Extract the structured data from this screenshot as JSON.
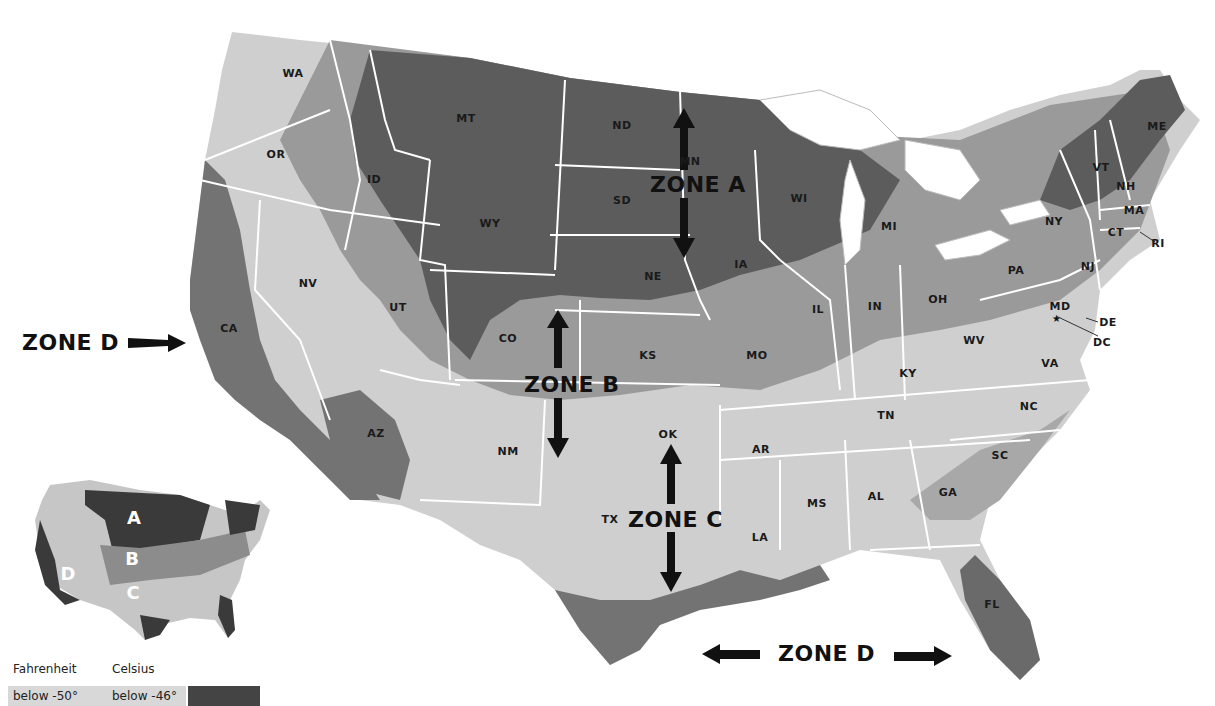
{
  "map": {
    "title": "US Climate Zones",
    "colors": {
      "zone_a": "#5a5a5a",
      "zone_a_dark": "#4a4a4a",
      "zone_b": "#8c8c8c",
      "zone_c": "#c8c8c8",
      "zone_c_light": "#dcdcdc",
      "zone_d": "#6e6e6e",
      "border": "#ffffff",
      "water": "#ffffff"
    },
    "states": [
      {
        "abbr": "WA",
        "x": 293,
        "y": 73
      },
      {
        "abbr": "OR",
        "x": 276,
        "y": 154
      },
      {
        "abbr": "ID",
        "x": 374,
        "y": 179
      },
      {
        "abbr": "MT",
        "x": 466,
        "y": 118
      },
      {
        "abbr": "WY",
        "x": 490,
        "y": 223
      },
      {
        "abbr": "NV",
        "x": 308,
        "y": 283
      },
      {
        "abbr": "UT",
        "x": 398,
        "y": 307
      },
      {
        "abbr": "CA",
        "x": 229,
        "y": 328
      },
      {
        "abbr": "AZ",
        "x": 376,
        "y": 433
      },
      {
        "abbr": "CO",
        "x": 508,
        "y": 338
      },
      {
        "abbr": "NM",
        "x": 508,
        "y": 451
      },
      {
        "abbr": "ND",
        "x": 622,
        "y": 125
      },
      {
        "abbr": "SD",
        "x": 622,
        "y": 200
      },
      {
        "abbr": "NE",
        "x": 653,
        "y": 276
      },
      {
        "abbr": "KS",
        "x": 648,
        "y": 355
      },
      {
        "abbr": "OK",
        "x": 668,
        "y": 434
      },
      {
        "abbr": "TX",
        "x": 610,
        "y": 519
      },
      {
        "abbr": "MN",
        "x": 690,
        "y": 161
      },
      {
        "abbr": "IA",
        "x": 741,
        "y": 264
      },
      {
        "abbr": "MO",
        "x": 757,
        "y": 355
      },
      {
        "abbr": "AR",
        "x": 761,
        "y": 449
      },
      {
        "abbr": "LA",
        "x": 760,
        "y": 537
      },
      {
        "abbr": "WI",
        "x": 799,
        "y": 198
      },
      {
        "abbr": "IL",
        "x": 818,
        "y": 309
      },
      {
        "abbr": "MI",
        "x": 889,
        "y": 226
      },
      {
        "abbr": "IN",
        "x": 875,
        "y": 306
      },
      {
        "abbr": "OH",
        "x": 938,
        "y": 299
      },
      {
        "abbr": "KY",
        "x": 908,
        "y": 373
      },
      {
        "abbr": "TN",
        "x": 886,
        "y": 415
      },
      {
        "abbr": "MS",
        "x": 817,
        "y": 503
      },
      {
        "abbr": "AL",
        "x": 876,
        "y": 496
      },
      {
        "abbr": "GA",
        "x": 948,
        "y": 492
      },
      {
        "abbr": "FL",
        "x": 992,
        "y": 604
      },
      {
        "abbr": "SC",
        "x": 1000,
        "y": 455
      },
      {
        "abbr": "NC",
        "x": 1029,
        "y": 406
      },
      {
        "abbr": "VA",
        "x": 1050,
        "y": 363
      },
      {
        "abbr": "WV",
        "x": 974,
        "y": 340
      },
      {
        "abbr": "PA",
        "x": 1016,
        "y": 270
      },
      {
        "abbr": "NY",
        "x": 1054,
        "y": 221
      },
      {
        "abbr": "NJ",
        "x": 1088,
        "y": 266
      },
      {
        "abbr": "MD",
        "x": 1060,
        "y": 306
      },
      {
        "abbr": "DE",
        "x": 1108,
        "y": 322
      },
      {
        "abbr": "DC",
        "x": 1102,
        "y": 342
      },
      {
        "abbr": "VT",
        "x": 1101,
        "y": 167
      },
      {
        "abbr": "NH",
        "x": 1126,
        "y": 186
      },
      {
        "abbr": "ME",
        "x": 1157,
        "y": 126
      },
      {
        "abbr": "MA",
        "x": 1134,
        "y": 210
      },
      {
        "abbr": "CT",
        "x": 1116,
        "y": 232
      },
      {
        "abbr": "RI",
        "x": 1158,
        "y": 243
      }
    ],
    "zones": [
      {
        "id": "zone-a",
        "label": "ZONE A",
        "x": 650,
        "y": 172
      },
      {
        "id": "zone-b",
        "label": "ZONE B",
        "x": 524,
        "y": 372
      },
      {
        "id": "zone-c",
        "label": "ZONE C",
        "x": 628,
        "y": 507
      },
      {
        "id": "zone-d-west",
        "label": "ZONE D",
        "x": 22,
        "y": 330
      },
      {
        "id": "zone-d-south",
        "label": "ZONE D",
        "x": 778,
        "y": 641
      }
    ]
  },
  "inset": {
    "labels": [
      {
        "letter": "A",
        "x": 134,
        "y": 517
      },
      {
        "letter": "B",
        "x": 132,
        "y": 558
      },
      {
        "letter": "C",
        "x": 133,
        "y": 592
      },
      {
        "letter": "D",
        "x": 68,
        "y": 573
      }
    ]
  },
  "legend": {
    "fahrenheit_header": "Fahrenheit",
    "celsius_header": "Celsius",
    "rows": [
      {
        "fahrenheit": "below -50°",
        "celsius": "below -46°",
        "color": "#444444"
      }
    ]
  }
}
